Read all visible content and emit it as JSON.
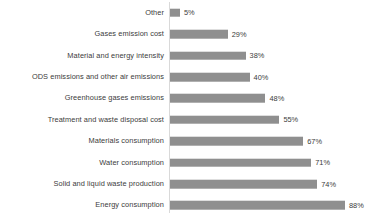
{
  "chart_data": {
    "type": "bar",
    "orientation": "horizontal",
    "title": "",
    "subtitle": "",
    "xlabel": "",
    "ylabel": "",
    "xlim": [
      0,
      100
    ],
    "grid": false,
    "legend": "none",
    "value_suffix": "%",
    "categories": [
      "Other",
      "Gases emission cost",
      "Material and energy intensity",
      "ODS emissions and other air emissions",
      "Greenhouse gases emissions",
      "Treatment and waste disposal cost",
      "Materials consumption",
      "Water consumption",
      "Solid and liquid waste production",
      "Energy consumption"
    ],
    "values": [
      5,
      29,
      38,
      40,
      48,
      55,
      67,
      71,
      74,
      88
    ],
    "value_labels": [
      "5%",
      "29%",
      "38%",
      "40%",
      "48%",
      "55%",
      "67%",
      "71%",
      "74%",
      "88%"
    ],
    "series": [
      {
        "name": "Share of respondents",
        "values": [
          5,
          29,
          38,
          40,
          48,
          55,
          67,
          71,
          74,
          88
        ]
      }
    ],
    "colors": {
      "bar": "#8f8f8f",
      "axis_line": "#d9d9d9",
      "text": "#3b3b3b",
      "background": "#ffffff"
    }
  }
}
